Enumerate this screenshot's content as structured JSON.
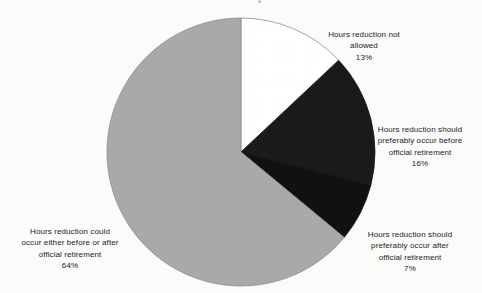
{
  "chart_data": {
    "type": "pie",
    "title": "",
    "subtitle": "",
    "xlabel": "",
    "ylabel": "",
    "legend_position": "none",
    "labels_position": "outside",
    "start_angle_deg": 0,
    "direction": "clockwise",
    "categories": [
      "Hours reduction not allowed",
      "Hours reduction should preferably occur before official retirement",
      "Hours reduction should preferably occur after official retirement",
      "Hours reduction could occur either before or after official retirement"
    ],
    "values": [
      13,
      16,
      7,
      64
    ],
    "value_suffix": "%",
    "total": 100,
    "slices": [
      {
        "name": "not-allowed",
        "label_lines": [
          "Hours reduction not",
          "allowed"
        ],
        "value": 13,
        "value_text": "13%",
        "color": "#ffffff",
        "stroke": "#8e8e8e",
        "start_deg": 0,
        "end_deg": 46.8
      },
      {
        "name": "before-retirement",
        "label_lines": [
          "Hours reduction should",
          "preferably occur before",
          "official retirement"
        ],
        "value": 16,
        "value_text": "16%",
        "color": "#1a1a1a",
        "stroke": "#1a1a1a",
        "start_deg": 46.8,
        "end_deg": 104.4
      },
      {
        "name": "after-retirement",
        "label_lines": [
          "Hours reduction should",
          "preferably occur after",
          "official retirement"
        ],
        "value": 7,
        "value_text": "7%",
        "color": "#111111",
        "stroke": "#111111",
        "start_deg": 104.4,
        "end_deg": 129.6
      },
      {
        "name": "either-before-or-after",
        "label_lines": [
          "Hours reduction could",
          "occur either before or after",
          "official retirement"
        ],
        "value": 64,
        "value_text": "64%",
        "color": "#a9a9a9",
        "stroke": "#8e8e8e",
        "start_deg": 129.6,
        "end_deg": 360
      }
    ],
    "geometry": {
      "center_x": 241,
      "center_y": 152,
      "radius": 134
    },
    "colors": {
      "background": "#fbfbfa",
      "gray_slice": "#a9a9a9",
      "black_slice": "#1a1a1a",
      "white_slice": "#ffffff",
      "outline": "#8e8e8e",
      "text": "#1c1c1c"
    }
  },
  "labels": {
    "not_allowed": {
      "text": "Hours reduction not\nallowed",
      "pct": "13%"
    },
    "before": {
      "text": "Hours reduction should\npreferably occur before\nofficial retirement",
      "pct": "16%"
    },
    "after": {
      "text": "Hours reduction should\npreferably occur after\nofficial retirement",
      "pct": "7%"
    },
    "either": {
      "text": "Hours reduction could\noccur either before or after\nofficial retirement",
      "pct": "64%"
    }
  }
}
